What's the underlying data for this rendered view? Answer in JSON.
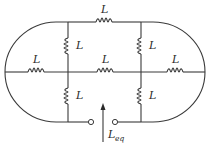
{
  "diagram": {
    "type": "circuit",
    "component_label": "L",
    "inductor_labels": {
      "top": "L",
      "left_upper_vertical": "L",
      "right_upper_vertical": "L",
      "middle_left": "L",
      "middle_center": "L",
      "middle_right": "L",
      "left_lower_vertical": "L",
      "right_lower_vertical": "L"
    },
    "equivalent_label": {
      "main": "L",
      "subscript": "eq"
    },
    "colors": {
      "line": "#3a3a3a",
      "background": "#ffffff"
    }
  }
}
